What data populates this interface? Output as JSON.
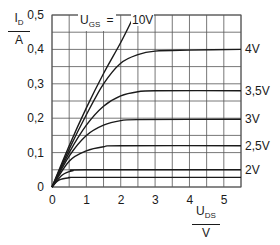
{
  "chart_data": {
    "type": "line",
    "xlabel": "U_DS / V",
    "ylabel": "I_D / A",
    "xlim": [
      0,
      5.5
    ],
    "ylim": [
      0,
      0.5
    ],
    "x_ticks": [
      "0",
      "1",
      "2",
      "3",
      "4",
      "5"
    ],
    "y_ticks": [
      "0",
      "0,1",
      "0,2",
      "0,3",
      "0,4",
      "0,5"
    ],
    "grid": true,
    "legend_header": "U_GS =",
    "series": [
      {
        "name": "10V",
        "points": [
          [
            0,
            0
          ],
          [
            0.5,
            0.12
          ],
          [
            1,
            0.23
          ],
          [
            1.5,
            0.33
          ],
          [
            2,
            0.42
          ],
          [
            2.4,
            0.5
          ]
        ]
      },
      {
        "name": "4V",
        "points": [
          [
            0,
            0
          ],
          [
            0.5,
            0.11
          ],
          [
            1,
            0.21
          ],
          [
            1.5,
            0.3
          ],
          [
            2,
            0.36
          ],
          [
            2.5,
            0.385
          ],
          [
            3,
            0.395
          ],
          [
            4,
            0.398
          ],
          [
            5.5,
            0.4
          ]
        ]
      },
      {
        "name": "3,5V",
        "points": [
          [
            0,
            0
          ],
          [
            0.5,
            0.1
          ],
          [
            1,
            0.18
          ],
          [
            1.5,
            0.235
          ],
          [
            2,
            0.265
          ],
          [
            2.5,
            0.277
          ],
          [
            3,
            0.28
          ],
          [
            5.5,
            0.28
          ]
        ]
      },
      {
        "name": "3V",
        "points": [
          [
            0,
            0
          ],
          [
            0.5,
            0.09
          ],
          [
            1,
            0.15
          ],
          [
            1.5,
            0.18
          ],
          [
            2,
            0.193
          ],
          [
            2.5,
            0.196
          ],
          [
            5.5,
            0.197
          ]
        ]
      },
      {
        "name": "2,5V",
        "points": [
          [
            0,
            0
          ],
          [
            0.5,
            0.075
          ],
          [
            1,
            0.105
          ],
          [
            1.5,
            0.117
          ],
          [
            2,
            0.12
          ],
          [
            5.5,
            0.12
          ]
        ]
      },
      {
        "name": "2V",
        "points": [
          [
            0,
            0
          ],
          [
            0.3,
            0.035
          ],
          [
            0.6,
            0.047
          ],
          [
            1,
            0.05
          ],
          [
            5.5,
            0.05
          ]
        ]
      },
      {
        "name": "",
        "points": [
          [
            0,
            0
          ],
          [
            0.2,
            0.02
          ],
          [
            0.5,
            0.027
          ],
          [
            1,
            0.028
          ],
          [
            5.5,
            0.028
          ]
        ]
      }
    ],
    "curve_labels": [
      {
        "text": "4V",
        "y": 0.4
      },
      {
        "text": "3,5V",
        "y": 0.28
      },
      {
        "text": "3V",
        "y": 0.197
      },
      {
        "text": "2,5V",
        "y": 0.12
      },
      {
        "text": "2V",
        "y": 0.05
      }
    ]
  },
  "labels": {
    "y_axis_main": "I",
    "y_axis_sub": "D",
    "y_axis_unit": "A",
    "x_axis_main": "U",
    "x_axis_sub": "DS",
    "x_axis_unit": "V",
    "ugs_main": "U",
    "ugs_sub": "GS",
    "ugs_eq": "=",
    "ugs_10v": "10V"
  },
  "colors": {
    "line": "#1a1a1a",
    "grid": "#555555",
    "background": "#ffffff"
  }
}
